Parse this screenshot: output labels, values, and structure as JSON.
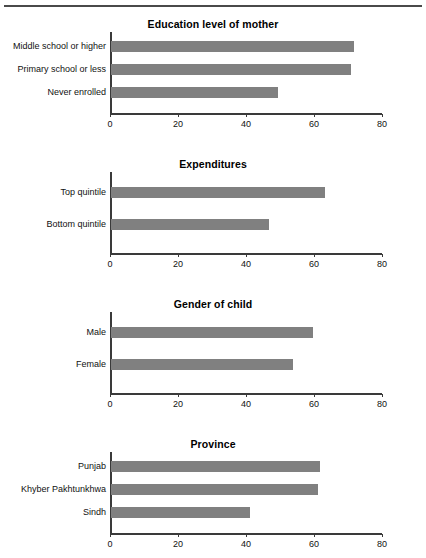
{
  "chart_data": [
    {
      "type": "bar",
      "orientation": "horizontal",
      "title": "Education level of mother",
      "xlabel": "",
      "ylabel": "",
      "xlim": [
        0,
        80
      ],
      "xticks": [
        0,
        20,
        40,
        60,
        80
      ],
      "grid": false,
      "legend": "none",
      "bar_color": "#808080",
      "categories": [
        "Middle school or higher",
        "Primary school or less",
        "Never enrolled"
      ],
      "values": [
        71.5,
        70.5,
        49
      ]
    },
    {
      "type": "bar",
      "orientation": "horizontal",
      "title": "Expenditures",
      "xlabel": "",
      "ylabel": "",
      "xlim": [
        0,
        80
      ],
      "xticks": [
        0,
        20,
        40,
        60,
        80
      ],
      "grid": false,
      "legend": "none",
      "bar_color": "#808080",
      "categories": [
        "Top quintile",
        "Bottom quintile"
      ],
      "values": [
        63,
        46.5
      ]
    },
    {
      "type": "bar",
      "orientation": "horizontal",
      "title": "Gender of child",
      "xlabel": "",
      "ylabel": "",
      "xlim": [
        0,
        80
      ],
      "xticks": [
        0,
        20,
        40,
        60,
        80
      ],
      "grid": false,
      "legend": "none",
      "bar_color": "#808080",
      "categories": [
        "Male",
        "Female"
      ],
      "values": [
        59.5,
        53.5
      ]
    },
    {
      "type": "bar",
      "orientation": "horizontal",
      "title": "Province",
      "xlabel": "",
      "ylabel": "",
      "xlim": [
        0,
        80
      ],
      "xticks": [
        0,
        20,
        40,
        60,
        80
      ],
      "grid": false,
      "legend": "none",
      "bar_color": "#808080",
      "categories": [
        "Punjab",
        "Khyber Pakhtunkhwa",
        "Sindh"
      ],
      "values": [
        61.5,
        61,
        41
      ]
    }
  ]
}
